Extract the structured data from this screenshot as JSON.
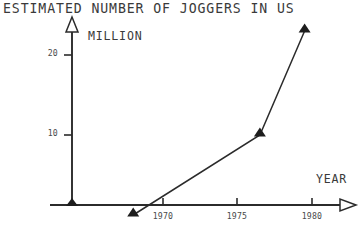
{
  "chart_data": {
    "type": "line",
    "title": "ESTIMATED NUMBER OF JOGGERS IN US",
    "subtitle": "",
    "xlabel": "YEAR",
    "ylabel": "MILLION",
    "x": [
      1968,
      1976.5,
      1979.5
    ],
    "values": [
      0,
      10,
      23
    ],
    "series": [
      {
        "name": "Estimated joggers",
        "x": [
          1968,
          1976.5,
          1979.5
        ],
        "values": [
          0,
          10,
          23
        ]
      }
    ],
    "points": [
      {
        "x": 1968,
        "y": 0,
        "px": 127,
        "py": 205
      },
      {
        "x": 1976.5,
        "y": 10,
        "px": 243,
        "py": 135
      },
      {
        "x": 1979.5,
        "y": 23,
        "px": 307,
        "py": 31
      }
    ],
    "origin_marker": {
      "px": 72,
      "py": 205
    },
    "xlim": [
      1965.6,
      1982.2
    ],
    "ylim": [
      0,
      25.5
    ],
    "xticks": [
      1970,
      1975,
      1980
    ],
    "xtick_labels": [
      "1970",
      "1975",
      "1980"
    ],
    "yticks": [
      10,
      20
    ],
    "ytick_labels": [
      "10",
      "20"
    ],
    "grid": false,
    "legend": false,
    "legend_position": "none",
    "marker": "filled-triangle",
    "line_color": "#2b2b2b",
    "axis_color": "#2b2b2b",
    "text_color": "#3a3a3a",
    "background_color": "#ffffff",
    "axis_arrowheads": "hollow-triangle"
  },
  "axes": {
    "y_axis_name": "vertical-axis",
    "x_axis_name": "horizontal-axis"
  },
  "geometry": {
    "y_axis_x": 72,
    "x_axis_y": 205,
    "y_axis_top": 31,
    "x_axis_right": 340,
    "tick_1970_px": 163,
    "tick_1975_px": 237,
    "tick_1980_px": 312,
    "tick_10_py": 135,
    "tick_20_py": 55
  }
}
